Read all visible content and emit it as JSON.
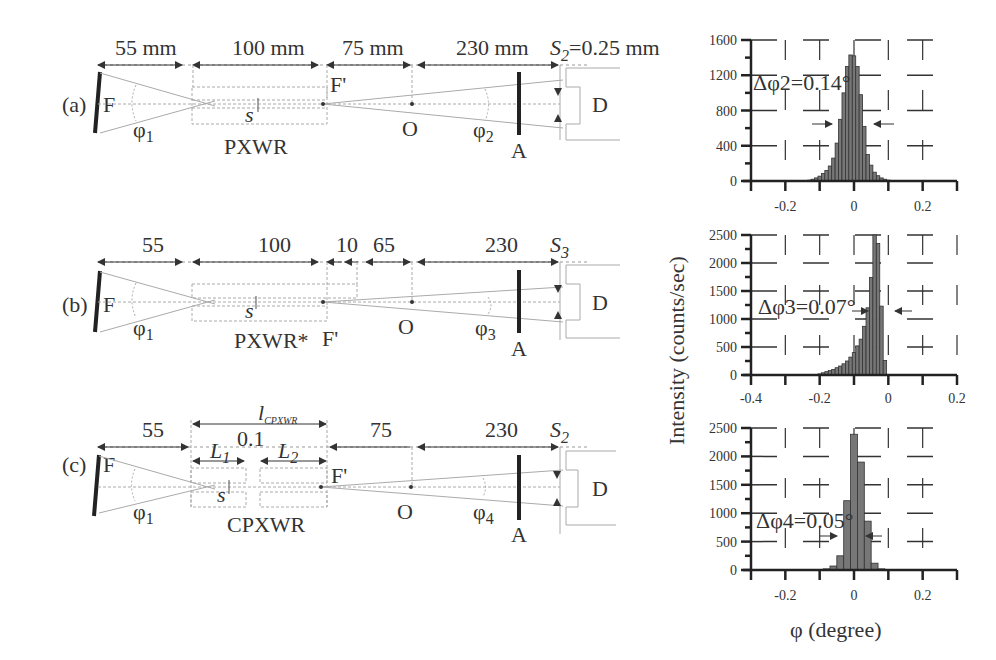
{
  "panels": [
    {
      "id": "a",
      "label": "(a)",
      "source": "F",
      "dims": [
        "55 mm",
        "100 mm",
        "75 mm",
        "230 mm"
      ],
      "slit": "S",
      "slit_sub": "2",
      "slit_value": "=0.25 mm",
      "angle_in": "φ",
      "angle_in_sub": "1",
      "angle_out": "φ",
      "angle_out_sub": "2",
      "crystal": "PXWR",
      "focus": "F'",
      "center": "O",
      "analyzer": "A",
      "detector": "D",
      "spacing": "s"
    },
    {
      "id": "b",
      "label": "(b)",
      "source": "F",
      "dims": [
        "55",
        "100",
        "10",
        "65",
        "230"
      ],
      "slit": "S",
      "slit_sub": "3",
      "slit_value": "",
      "angle_in": "φ",
      "angle_in_sub": "1",
      "angle_out": "φ",
      "angle_out_sub": "3",
      "crystal": "PXWR*",
      "focus": "F'",
      "center": "O",
      "analyzer": "A",
      "detector": "D",
      "spacing": "s"
    },
    {
      "id": "c",
      "label": "(c)",
      "source": "F",
      "dims": [
        "55",
        "0.1",
        "75",
        "230"
      ],
      "total_length": "l",
      "total_length_sub": "CPXWR",
      "seg1": "L",
      "seg1_sub": "1",
      "seg2": "L",
      "seg2_sub": "2",
      "slit": "S",
      "slit_sub": "2",
      "slit_value": "",
      "angle_in": "φ",
      "angle_in_sub": "1",
      "angle_out": "φ",
      "angle_out_sub": "4",
      "crystal": "CPXWR",
      "focus": "F'",
      "center": "O",
      "analyzer": "A",
      "detector": "D",
      "spacing": "s"
    }
  ],
  "chart_data": [
    {
      "type": "bar",
      "title": "",
      "annotation": "Δφ2=0.14°",
      "xlabel": "",
      "ylabel": "Intensity (counts/sec)",
      "xlim": [
        -0.3,
        0.3
      ],
      "ylim": [
        0,
        1600
      ],
      "xticks": [
        "-0.2",
        "0",
        "0.2"
      ],
      "yticks": [
        "0",
        "400",
        "800",
        "1200",
        "1600"
      ],
      "grid": "dashed",
      "x": [
        -0.13,
        -0.12,
        -0.11,
        -0.1,
        -0.09,
        -0.08,
        -0.07,
        -0.06,
        -0.05,
        -0.04,
        -0.03,
        -0.02,
        -0.01,
        0.0,
        0.01,
        0.02,
        0.03,
        0.04,
        0.05,
        0.06,
        0.07,
        0.08,
        0.09,
        0.1,
        0.11,
        0.12,
        0.13
      ],
      "values": [
        10,
        20,
        35,
        55,
        85,
        120,
        170,
        260,
        430,
        700,
        1000,
        1300,
        1430,
        1420,
        1300,
        980,
        620,
        300,
        180,
        100,
        60,
        35,
        20,
        10,
        5,
        3,
        2
      ]
    },
    {
      "type": "bar",
      "title": "",
      "annotation": "Δφ3=0.07°",
      "xlabel": "",
      "ylabel": "Intensity (counts/sec)",
      "xlim": [
        -0.4,
        0.2
      ],
      "ylim": [
        0,
        2500
      ],
      "xticks": [
        "-0.4",
        "-0.2",
        "0",
        "0.2"
      ],
      "yticks": [
        "0",
        "500",
        "1000",
        "1500",
        "2000",
        "2500"
      ],
      "grid": "dashed",
      "x": [
        -0.2,
        -0.19,
        -0.18,
        -0.17,
        -0.16,
        -0.15,
        -0.14,
        -0.13,
        -0.12,
        -0.11,
        -0.1,
        -0.09,
        -0.08,
        -0.07,
        -0.06,
        -0.05,
        -0.04,
        -0.03,
        -0.02,
        -0.01,
        0.0,
        0.01
      ],
      "values": [
        20,
        40,
        60,
        80,
        100,
        130,
        160,
        200,
        250,
        320,
        400,
        520,
        640,
        870,
        1200,
        1740,
        2500,
        2350,
        1230,
        260,
        0,
        0
      ]
    },
    {
      "type": "bar",
      "title": "",
      "annotation": "Δφ4=0.05°",
      "xlabel": "φ (degree)",
      "ylabel": "Intensity (counts/sec)",
      "xlim": [
        -0.3,
        0.3
      ],
      "ylim": [
        0,
        2500
      ],
      "xticks": [
        "-0.2",
        "0",
        "0.2"
      ],
      "yticks": [
        "0",
        "500",
        "1000",
        "1500",
        "2000",
        "2500"
      ],
      "grid": "dashed",
      "x": [
        -0.08,
        -0.06,
        -0.04,
        -0.02,
        0.0,
        0.02,
        0.04,
        0.06,
        0.08
      ],
      "values": [
        20,
        70,
        250,
        1220,
        2390,
        1900,
        860,
        120,
        20
      ]
    }
  ]
}
